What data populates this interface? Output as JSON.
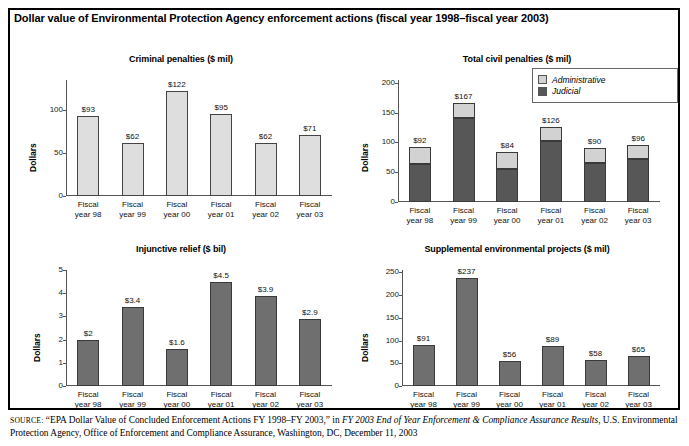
{
  "main_title": "Dollar value of Environmental Protection Agency enforcement actions (fiscal year 1998–fiscal year 2003)",
  "source": {
    "keyword": "SOURCE:",
    "part1": " “EPA Dollar Value of Concluded Enforcement Actions FY 1998–FY 2003,” in ",
    "italic1": "FY 2003 End of Year Enforcement & Compliance Assurance Results",
    "part2": ", U.S. Environmental Protection Agency, Office of Enforcement and Compliance Assurance, Washington, DC, December 11, 2003"
  },
  "colors": {
    "light_bar": "#dedede",
    "mid_bar": "#6f6f6f",
    "administrative": "#d2d2d2",
    "judicial": "#575757",
    "axis": "#555555",
    "border": "#000000"
  },
  "ylabel": "Dollars",
  "categories": [
    "Fiscal\nyear 98",
    "Fiscal\nyear 99",
    "Fiscal\nyear 00",
    "Fiscal\nyear 01",
    "Fiscal\nyear 02",
    "Fiscal\nyear 03"
  ],
  "chart_data": [
    {
      "type": "bar",
      "title": "Criminal penalties ($ mil)",
      "xlabel": "",
      "ylabel": "Dollars",
      "categories": [
        "Fiscal year 98",
        "Fiscal year 99",
        "Fiscal year 00",
        "Fiscal year 01",
        "Fiscal year 02",
        "Fiscal year 03"
      ],
      "cat_line1": [
        "Fiscal",
        "Fiscal",
        "Fiscal",
        "Fiscal",
        "Fiscal",
        "Fiscal"
      ],
      "cat_line2": [
        "year 98",
        "year 99",
        "year 00",
        "year 01",
        "year 02",
        "year 03"
      ],
      "values": [
        93,
        62,
        122,
        95,
        62,
        71
      ],
      "data_labels": [
        "$93",
        "$62",
        "$122",
        "$95",
        "$62",
        "$71"
      ],
      "ticks": [
        0,
        50,
        100
      ],
      "tick_labels": [
        "0",
        "50",
        "100"
      ],
      "ylim": [
        0,
        135
      ],
      "grid": false,
      "legend": null
    },
    {
      "type": "bar",
      "subtype": "stacked",
      "title": "Total civil penalties ($ mil)",
      "xlabel": "",
      "ylabel": "Dollars",
      "categories": [
        "Fiscal year 98",
        "Fiscal year 99",
        "Fiscal year 00",
        "Fiscal year 01",
        "Fiscal year 02",
        "Fiscal year 03"
      ],
      "cat_line1": [
        "Fiscal",
        "Fiscal",
        "Fiscal",
        "Fiscal",
        "Fiscal",
        "Fiscal"
      ],
      "cat_line2": [
        "year 98",
        "year 99",
        "year 00",
        "year 01",
        "year 02",
        "year 03"
      ],
      "series": [
        {
          "name": "Judicial",
          "values": [
            64,
            142,
            56,
            103,
            65,
            73
          ],
          "color": "#575757"
        },
        {
          "name": "Administrative",
          "values": [
            28,
            25,
            28,
            23,
            25,
            23
          ],
          "color": "#d2d2d2"
        }
      ],
      "totals": [
        92,
        167,
        84,
        126,
        90,
        96
      ],
      "data_labels": [
        "$92",
        "$167",
        "$84",
        "$126",
        "$90",
        "$96"
      ],
      "ticks": [
        0,
        50,
        100,
        150,
        200
      ],
      "tick_labels": [
        "0",
        "50",
        "100",
        "150",
        "200"
      ],
      "ylim": [
        0,
        205
      ],
      "grid": false,
      "legend": {
        "position": "top-right",
        "entries": [
          "Administrative",
          "Judicial"
        ]
      }
    },
    {
      "type": "bar",
      "title": "Injunctive relief ($ bil)",
      "xlabel": "",
      "ylabel": "Dollars",
      "categories": [
        "Fiscal year 98",
        "Fiscal year 99",
        "Fiscal year 00",
        "Fiscal year 01",
        "Fiscal year 02",
        "Fiscal year 03"
      ],
      "cat_line1": [
        "Fiscal",
        "Fiscal",
        "Fiscal",
        "Fiscal",
        "Fiscal",
        "Fiscal"
      ],
      "cat_line2": [
        "year 98",
        "year 99",
        "year 00",
        "year 01",
        "year 02",
        "year 03"
      ],
      "values": [
        2,
        3.4,
        1.6,
        4.5,
        3.9,
        2.9
      ],
      "data_labels": [
        "$2",
        "$3.4",
        "$1.6",
        "$4.5",
        "$3.9",
        "$2.9"
      ],
      "ticks": [
        0,
        1,
        2,
        3,
        4,
        5
      ],
      "tick_labels": [
        "0",
        "1",
        "2",
        "3",
        "4",
        "5"
      ],
      "ylim": [
        0,
        5
      ],
      "grid": false,
      "legend": null
    },
    {
      "type": "bar",
      "title": "Supplemental environmental projects ($ mil)",
      "xlabel": "",
      "ylabel": "Dollars",
      "categories": [
        "Fiscal year 98",
        "Fiscal year 99",
        "Fiscal year 00",
        "Fiscal year 01",
        "Fiscal year 02",
        "Fiscal year 03"
      ],
      "cat_line1": [
        "Fiscal",
        "Fiscal",
        "Fiscal",
        "Fiscal",
        "Fiscal",
        "Fiscal"
      ],
      "cat_line2": [
        "year 98",
        "year 99",
        "year 00",
        "year 01",
        "year 02",
        "year 03"
      ],
      "values": [
        91,
        237,
        56,
        89,
        58,
        65
      ],
      "data_labels": [
        "$91",
        "$237",
        "$56",
        "$89",
        "$58",
        "$65"
      ],
      "ticks": [
        0,
        50,
        100,
        150,
        200,
        250
      ],
      "tick_labels": [
        "0",
        "50",
        "100",
        "150",
        "200",
        "250"
      ],
      "ylim": [
        0,
        255
      ],
      "grid": false,
      "legend": null
    }
  ]
}
